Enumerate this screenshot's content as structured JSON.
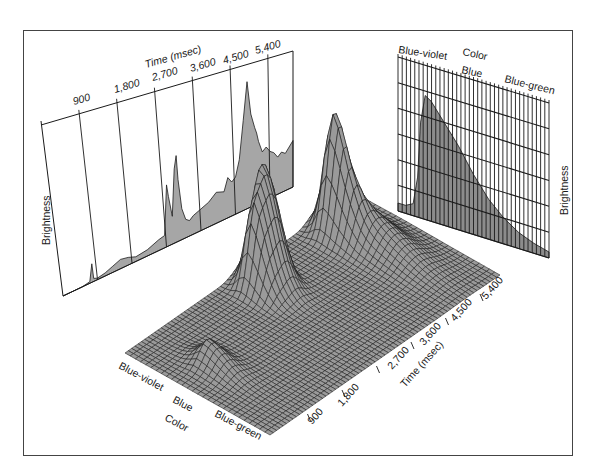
{
  "figure": {
    "frame_color": "#444444",
    "fill_gray": "#a6a6a6",
    "surface_gray": "#9a9a9a",
    "line_color": "#1a1a1a"
  },
  "left_panel": {
    "axis_title": "Time (msec)",
    "ylabel": "Brightness",
    "ticks": [
      "900",
      "1,800",
      "2,700",
      "3,600",
      "4,500",
      "5,400"
    ]
  },
  "right_panel": {
    "axis_title": "Color",
    "ylabel": "Brightness",
    "ticks": [
      "Blue-violet",
      "Blue",
      "Blue-green"
    ]
  },
  "surface": {
    "color_axis_title": "Color",
    "color_ticks": [
      "Blue-violet",
      "Blue",
      "Blue-green"
    ],
    "time_axis_title": "Time (msec)",
    "time_ticks": [
      "900",
      "1,800",
      "2,700",
      "3,600",
      "4,500",
      "5,400"
    ]
  },
  "chart_data": [
    {
      "type": "area",
      "title": "Brightness over time (projection)",
      "xlabel": "Time (msec)",
      "ylabel": "Brightness",
      "x_ticks": [
        900,
        1800,
        2700,
        3600,
        4500,
        5400
      ],
      "xlim": [
        0,
        6000
      ],
      "x": [
        0,
        500,
        700,
        750,
        800,
        900,
        1100,
        1300,
        1500,
        1700,
        1900,
        2200,
        2500,
        2650,
        2700,
        2750,
        2850,
        2900,
        2950,
        3000,
        3100,
        3200,
        3300,
        3400,
        3600,
        3800,
        4000,
        4200,
        4300,
        4400,
        4500,
        4600,
        4700,
        4800,
        4900,
        5000,
        5050,
        5100,
        5200,
        5300,
        5400,
        5500,
        5600,
        5700,
        5800,
        6000
      ],
      "values": [
        0,
        0,
        1,
        12,
        2,
        1,
        2,
        4,
        6,
        5,
        3,
        4,
        7,
        8,
        40,
        32,
        18,
        48,
        56,
        40,
        20,
        12,
        10,
        12,
        14,
        16,
        20,
        18,
        26,
        22,
        24,
        34,
        58,
        82,
        60,
        50,
        46,
        40,
        32,
        34,
        30,
        28,
        24,
        26,
        24,
        30
      ],
      "grid": false
    },
    {
      "type": "area",
      "title": "Brightness by color (projection)",
      "xlabel": "Color",
      "ylabel": "Brightness",
      "x_ticks": [
        "Blue-violet",
        "Blue",
        "Blue-green"
      ],
      "x": [
        0,
        0.05,
        0.1,
        0.13,
        0.15,
        0.18,
        0.22,
        0.3,
        0.4,
        0.5,
        0.6,
        0.7,
        0.8,
        0.9,
        1.0
      ],
      "values": [
        4,
        4,
        6,
        20,
        48,
        62,
        60,
        52,
        42,
        30,
        20,
        13,
        8,
        5,
        3
      ],
      "grid": true
    },
    {
      "type": "surface",
      "title": "Brightness by time and color",
      "xlabel": "Time (msec)",
      "ylabel": "Color",
      "zlabel": "Brightness",
      "x_ticks": [
        900,
        1800,
        2700,
        3600,
        4500,
        5400
      ],
      "y_ticks": [
        "Blue-violet",
        "Blue",
        "Blue-green"
      ],
      "peaks": [
        {
          "time_msec": 800,
          "color": "Blue-violet",
          "brightness": 15
        },
        {
          "time_msec": 2750,
          "color": "Blue-violet",
          "brightness": 45
        },
        {
          "time_msec": 2950,
          "color": "Blue-violet",
          "brightness": 55
        },
        {
          "time_msec": 4800,
          "color": "Blue-violet",
          "brightness": 80
        }
      ]
    }
  ]
}
